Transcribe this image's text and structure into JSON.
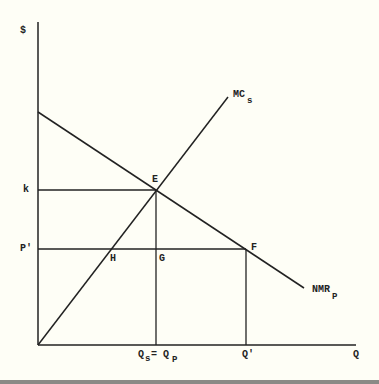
{
  "diagram": {
    "type": "economics-supply-demand",
    "y_axis_label": "$",
    "x_axis_label": "Q",
    "curves": {
      "mc": {
        "label": "MC",
        "subscript": "s"
      },
      "nmr": {
        "label": "NMR",
        "subscript": "P"
      }
    },
    "points": {
      "E": "E",
      "F": "F",
      "G": "G",
      "H": "H"
    },
    "y_ticks": {
      "k": "k",
      "p_prime": "P'"
    },
    "x_ticks": {
      "qs_main": "Q",
      "qs_sub": "s",
      "eq": "= Q",
      "qp_sub": "P",
      "q_prime": "Q'"
    },
    "colors": {
      "background": "#fefef6",
      "ink": "#222222"
    }
  }
}
